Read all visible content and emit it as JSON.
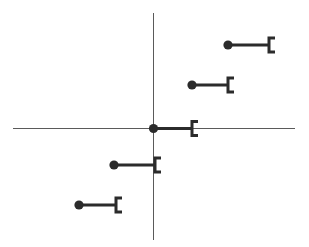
{
  "figure": {
    "width": 309,
    "height": 247,
    "background_color": "#ffffff"
  },
  "axes": {
    "vertical": {
      "label": "vertical-axis",
      "x": 153.5,
      "y_start": 13,
      "y_end": 240,
      "color": "#5a5a5a"
    },
    "horizontal": {
      "label": "horizontal-axis",
      "y": 128.5,
      "x_start": 13,
      "x_end": 295,
      "color": "#5a5a5a"
    },
    "origin": {
      "x": 153.5,
      "y": 128.5
    }
  },
  "chart_data": {
    "type": "scatter",
    "title": "",
    "xlabel": "",
    "ylabel": "",
    "grid": false,
    "legend": null,
    "xlim": [
      13,
      295
    ],
    "ylim": [
      13,
      240
    ],
    "marker_color": "#2b2b2b",
    "axis_color": "#5a5a5a",
    "dot_radius": 4.6,
    "bar_thickness": 3,
    "bracket_arm_length": 6,
    "bracket_half_height": 7,
    "series": [
      {
        "name": "intervals",
        "points": [
          {
            "id": "row-1",
            "dot_x": 228,
            "dot_y": 45,
            "bracket_x": 269
          },
          {
            "id": "row-2",
            "dot_x": 192,
            "dot_y": 85,
            "bracket_x": 228
          },
          {
            "id": "row-3",
            "dot_x": 153.5,
            "dot_y": 128.5,
            "bracket_x": 192
          },
          {
            "id": "row-4",
            "dot_x": 114,
            "dot_y": 165,
            "bracket_x": 155
          },
          {
            "id": "row-5",
            "dot_x": 79,
            "dot_y": 205,
            "bracket_x": 116
          }
        ]
      }
    ]
  }
}
